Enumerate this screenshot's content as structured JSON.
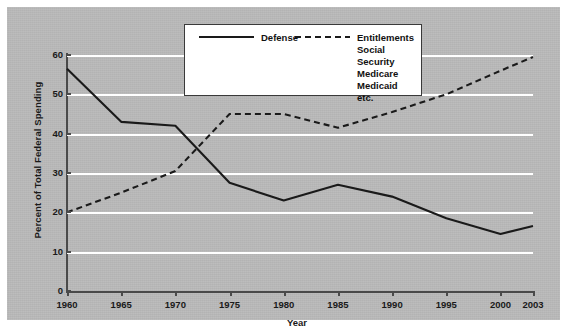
{
  "chart_data": {
    "type": "line",
    "title": "",
    "xlabel": "Year",
    "ylabel": "Percent of Total Federal Spending",
    "x": [
      1960,
      1965,
      1970,
      1975,
      1980,
      1985,
      1990,
      1995,
      2000,
      2003
    ],
    "xlim": [
      1960,
      2003
    ],
    "ylim": [
      0,
      60
    ],
    "yticks": [
      0,
      10,
      20,
      30,
      40,
      50,
      60
    ],
    "xticks": [
      1960,
      1965,
      1970,
      1975,
      1980,
      1985,
      1990,
      1995,
      2000,
      2003
    ],
    "xtick_labels": [
      "1960",
      "1965",
      "1970",
      "1975",
      "1980",
      "1985",
      "1990",
      "1995",
      "2000",
      "2003"
    ],
    "ytick_labels": [
      "0",
      "10",
      "20",
      "30",
      "40",
      "50",
      "60"
    ],
    "grid": true,
    "grid_color": "#ffffff",
    "background_color": "#b9b9b9",
    "legend_position": "top-center",
    "series": [
      {
        "name": "Defense",
        "style": "solid",
        "color": "#1a1a1a",
        "values": [
          56.5,
          43.0,
          42.0,
          27.5,
          23.0,
          27.0,
          24.0,
          18.5,
          14.5,
          16.5
        ]
      },
      {
        "name": "Entitlements",
        "style": "dashed",
        "color": "#1a1a1a",
        "values": [
          20.0,
          25.0,
          30.5,
          45.0,
          45.0,
          41.5,
          45.5,
          50.0,
          56.0,
          59.5
        ]
      }
    ]
  },
  "legend": {
    "defense_label": "Defense",
    "entitlements_label": "Entitlements",
    "entitlements_sub": "Social Security\nMedicare\nMedicaid\netc."
  }
}
